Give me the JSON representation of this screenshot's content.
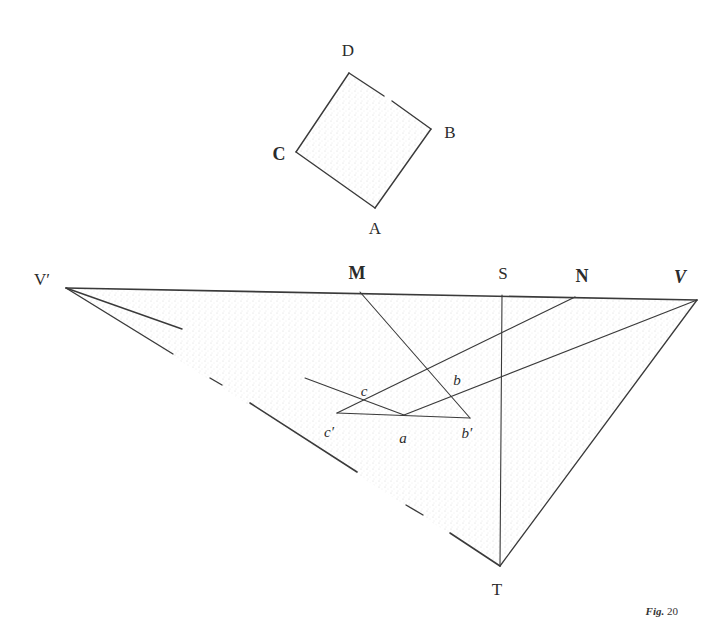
{
  "figure": {
    "caption_prefix": "Fig.",
    "caption_number": "20",
    "colors": {
      "ink": "#3a3a3a",
      "stipple": "#d9d9d9",
      "background": "#ffffff"
    }
  },
  "square": {
    "labels": {
      "D": "D",
      "B": "B",
      "A": "A",
      "C": "C"
    },
    "vertices": {
      "D": [
        349,
        73
      ],
      "B": [
        431,
        129
      ],
      "A": [
        375,
        208
      ],
      "C": [
        296,
        152
      ]
    }
  },
  "perspective": {
    "labels": {
      "V_prime": "V′",
      "M": "M",
      "S": "S",
      "N": "N",
      "V": "V",
      "T": "T",
      "c": "c",
      "b": "b",
      "c_prime": "c′",
      "a": "a",
      "b_prime": "b′"
    },
    "points": {
      "V_prime": [
        66,
        288
      ],
      "M": [
        360,
        292
      ],
      "S": [
        502,
        295
      ],
      "N": [
        575,
        297
      ],
      "V": [
        672,
        299
      ],
      "T": [
        500,
        566
      ],
      "c_prime": [
        337,
        413
      ],
      "a": [
        404,
        415
      ],
      "b_prime": [
        470,
        418
      ]
    }
  }
}
